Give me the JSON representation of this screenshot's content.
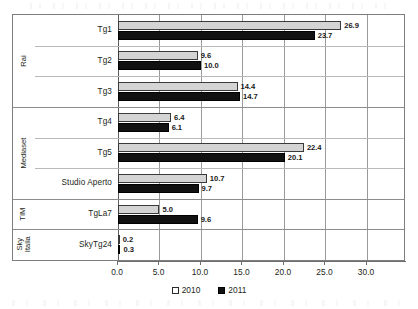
{
  "chart_data": {
    "type": "bar",
    "orientation": "horizontal",
    "title": "",
    "subtitle": "",
    "xlabel": "",
    "ylabel": "",
    "xlim": [
      0.0,
      34.7
    ],
    "xticks": [
      "0.0",
      "5.0",
      "10.0",
      "15.0",
      "20.0",
      "25.0",
      "30.0"
    ],
    "xtick_values": [
      0,
      5,
      10,
      15,
      20,
      25,
      30
    ],
    "grid": "vertical",
    "legend_position": "bottom-center",
    "categories": [
      "Tg1",
      "Tg2",
      "Tg3",
      "Tg4",
      "Tg5",
      "Studio Aperto",
      "TgLa7",
      "SkyTg24"
    ],
    "series": [
      {
        "name": "2010",
        "color": "#d4d4d4",
        "values": [
          26.9,
          9.6,
          14.4,
          6.4,
          22.4,
          10.7,
          5.0,
          0.2
        ],
        "labels": [
          "26.9",
          "9.6",
          "14.4",
          "6.4",
          "22.4",
          "10.7",
          "5.0",
          "0.2"
        ]
      },
      {
        "name": "2011",
        "color": "#111111",
        "values": [
          23.7,
          10.0,
          14.7,
          6.1,
          20.1,
          9.7,
          9.6,
          0.3
        ],
        "labels": [
          "23.7",
          "10.0",
          "14.7",
          "6.1",
          "20.1",
          "9.7",
          "9.6",
          "0.3"
        ]
      }
    ],
    "groups": [
      {
        "label": "Rai",
        "categories": [
          "Tg1",
          "Tg2",
          "Tg3"
        ]
      },
      {
        "label": "Mediaset",
        "categories": [
          "Tg4",
          "Tg5",
          "Studio Aperto"
        ]
      },
      {
        "label": "TIM",
        "categories": [
          "TgLa7"
        ]
      },
      {
        "label": "Sky Italia",
        "categories": [
          "SkyTg24"
        ]
      }
    ]
  },
  "legend": {
    "items": [
      {
        "label": "2010",
        "swatch": "open-square-swatch"
      },
      {
        "label": "2011",
        "swatch": "filled-square-swatch"
      }
    ]
  }
}
